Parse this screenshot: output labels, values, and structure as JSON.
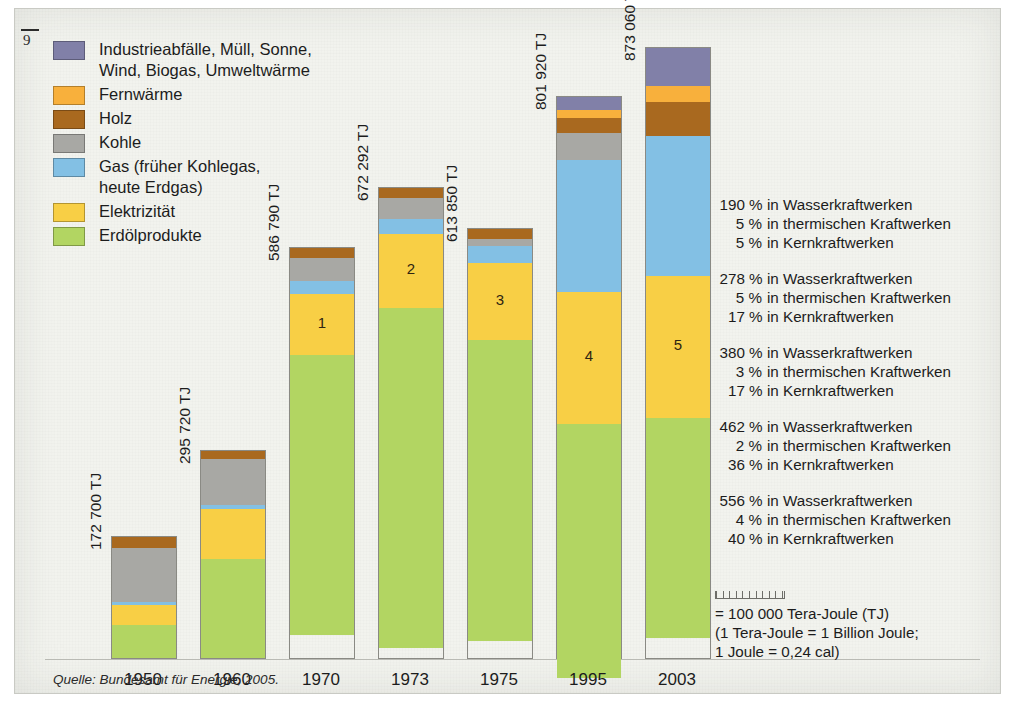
{
  "page": {
    "number": "9"
  },
  "legend": {
    "title": "Legende",
    "items": [
      {
        "label": "Industrieabfälle, Müll, Sonne,\nWind, Biogas, Umweltwärme",
        "key": "sonstige",
        "color": "#8180a8"
      },
      {
        "label": "Fernwärme",
        "key": "fernwaerme",
        "color": "#f8b03c"
      },
      {
        "label": "Holz",
        "key": "holz",
        "color": "#a9691f"
      },
      {
        "label": "Kohle",
        "key": "kohle",
        "color": "#a8a8a4"
      },
      {
        "label": "Gas (früher Kohlegas,\nheute Erdgas)",
        "key": "gas",
        "color": "#83c0e4"
      },
      {
        "label": "Elektrizität",
        "key": "elektrizitaet",
        "color": "#f8cf45"
      },
      {
        "label": "Erdölprodukte",
        "key": "erdoel",
        "color": "#b2d562"
      }
    ]
  },
  "chart_data": {
    "type": "bar",
    "stacked": true,
    "xlabel": "",
    "ylabel": "Tera-Joule (TJ)",
    "unit": "TJ",
    "categories": [
      "1950",
      "1960",
      "1970",
      "1973",
      "1975",
      "1995",
      "2003"
    ],
    "totals_label": [
      "172 700 TJ",
      "295 720 TJ",
      "586 790 TJ",
      "672 292 TJ",
      "613 850 TJ",
      "801 920 TJ",
      "873 060 TJ"
    ],
    "totals": [
      172700,
      295720,
      586790,
      672292,
      613850,
      801920,
      873060
    ],
    "series_order_bottom_to_top": [
      "erdoel",
      "elektrizitaet",
      "gas",
      "kohle",
      "holz",
      "fernwaerme",
      "sonstige"
    ],
    "series": [
      {
        "name": "Erdölprodukte",
        "key": "erdoel",
        "color": "#b2d562",
        "values": [
          47000,
          142000,
          400000,
          487000,
          430000,
          364000,
          315000
        ]
      },
      {
        "name": "Elektrizität",
        "key": "elektrizitaet",
        "color": "#f8cf45",
        "values": [
          29000,
          71000,
          88000,
          105000,
          110000,
          188000,
          203000
        ]
      },
      {
        "name": "Gas (früher Kohlegas, heute Erdgas)",
        "key": "gas",
        "color": "#83c0e4",
        "values": [
          4000,
          6000,
          19000,
          22000,
          25000,
          190000,
          200000
        ]
      },
      {
        "name": "Kohle",
        "key": "kohle",
        "color": "#a8a8a4",
        "values": [
          78000,
          66000,
          33000,
          30000,
          10000,
          38000,
          0
        ]
      },
      {
        "name": "Holz",
        "key": "holz",
        "color": "#a9691f",
        "values": [
          15000,
          11000,
          14000,
          14000,
          14000,
          21000,
          50000
        ]
      },
      {
        "name": "Fernwärme",
        "key": "fernwaerme",
        "color": "#f8b03c",
        "values": [
          0,
          0,
          0,
          0,
          0,
          12000,
          22000
        ]
      },
      {
        "name": "Industrieabfälle, Müll, Sonne, Wind, Biogas, Umweltwärme",
        "key": "sonstige",
        "color": "#8180a8",
        "values": [
          0,
          0,
          0,
          0,
          0,
          18000,
          55000
        ]
      }
    ],
    "grid": false,
    "legend_position": "top-left"
  },
  "notes": [
    {
      "index": "1",
      "lines": [
        {
          "pct": "90 %",
          "text": "in Wasserkraftwerken"
        },
        {
          "pct": "5 %",
          "text": "in thermischen Kraftwerken"
        },
        {
          "pct": "5 %",
          "text": "in Kernkraftwerken"
        }
      ]
    },
    {
      "index": "2",
      "lines": [
        {
          "pct": "78 %",
          "text": "in Wasserkraftwerken"
        },
        {
          "pct": "5 %",
          "text": "in thermischen Kraftwerken"
        },
        {
          "pct": "17 %",
          "text": "in Kernkraftwerken"
        }
      ]
    },
    {
      "index": "3",
      "lines": [
        {
          "pct": "80 %",
          "text": "in Wasserkraftwerken"
        },
        {
          "pct": "3 %",
          "text": "in thermischen Kraftwerken"
        },
        {
          "pct": "17 %",
          "text": "in Kernkraftwerken"
        }
      ]
    },
    {
      "index": "4",
      "lines": [
        {
          "pct": "62 %",
          "text": "in Wasserkraftwerken"
        },
        {
          "pct": "2 %",
          "text": "in thermischen Kraftwerken"
        },
        {
          "pct": "36 %",
          "text": "in Kernkraftwerken"
        }
      ]
    },
    {
      "index": "5",
      "lines": [
        {
          "pct": "56 %",
          "text": "in Wasserkraftwerken"
        },
        {
          "pct": "4 %",
          "text": "in thermischen Kraftwerken"
        },
        {
          "pct": "40 %",
          "text": "in Kernkraftwerken"
        }
      ]
    }
  ],
  "scale_key": {
    "line1": "= 100 000 Tera-Joule (TJ)",
    "line2": "(1 Tera-Joule = 1 Billion Joule;",
    "line3": "1 Joule = 0,24 cal)"
  },
  "source": {
    "text": "Quelle: Bundesamt für Energie, 2005."
  }
}
